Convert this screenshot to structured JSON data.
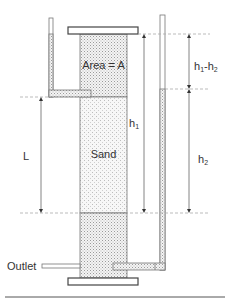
{
  "diagram": {
    "labels": {
      "area": "Area = A",
      "sand": "Sand",
      "length": "L",
      "h1": "h",
      "h1_sub": "1",
      "h2": "h",
      "h2_sub": "2",
      "diff_h": "h",
      "diff_sub1": "1",
      "diff_dash": "-h",
      "diff_sub2": "2",
      "outlet": "Outlet"
    },
    "colors": {
      "line": "#555555",
      "dashed": "#aaaaaa",
      "fill_water": "#e2e2e2",
      "fill_sand": "#efefef"
    }
  }
}
